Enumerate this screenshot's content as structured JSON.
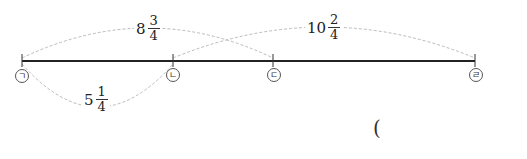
{
  "diagram": {
    "points": [
      {
        "id": "a",
        "label": "ㄱ",
        "x": 22
      },
      {
        "id": "b",
        "label": "ㄴ",
        "x": 173
      },
      {
        "id": "c",
        "label": "ㄷ",
        "x": 273
      },
      {
        "id": "d",
        "label": "ㄹ",
        "x": 475
      }
    ],
    "arcs": [
      {
        "from": "ㄱ",
        "to": "ㄷ",
        "whole": "8",
        "num": "3",
        "den": "4"
      },
      {
        "from": "ㄴ",
        "to": "ㄹ",
        "whole": "10",
        "num": "2",
        "den": "4"
      },
      {
        "from": "ㄱ",
        "to": "ㄴ",
        "whole": "5",
        "num": "1",
        "den": "4"
      }
    ],
    "answer_paren": "("
  }
}
